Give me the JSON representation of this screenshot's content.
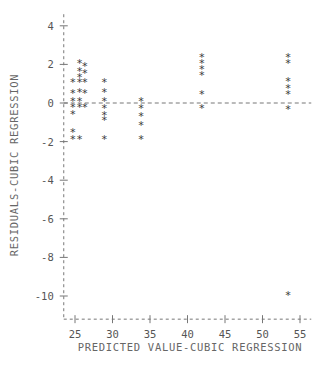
{
  "chart_data": {
    "type": "scatter",
    "title": "",
    "xlabel": "PREDICTED VALUE-CUBIC REGRESSION",
    "ylabel": "RESIDUALS-CUBIC REGRESSION",
    "xlim": [
      23.5,
      56.5
    ],
    "ylim": [
      -11.2,
      4.6
    ],
    "xticks": [
      25,
      30,
      35,
      40,
      45,
      50,
      55
    ],
    "xtick_labels": [
      "25",
      "30",
      "35",
      "40",
      "45",
      "50",
      "55"
    ],
    "yticks": [
      4,
      2,
      0,
      -2,
      -4,
      -6,
      -8,
      -10
    ],
    "ytick_labels": [
      "4",
      "2",
      "0",
      "-2",
      "-4",
      "-6",
      "-8",
      "-10"
    ],
    "grid": false,
    "legend": null,
    "marker_symbol": "*",
    "reference_line_y": 0,
    "points": [
      {
        "x": 24.7,
        "y": 1.05
      },
      {
        "x": 24.7,
        "y": 0.45
      },
      {
        "x": 24.7,
        "y": 0.05
      },
      {
        "x": 24.7,
        "y": -0.25
      },
      {
        "x": 24.7,
        "y": -0.6
      },
      {
        "x": 24.7,
        "y": -1.55
      },
      {
        "x": 24.7,
        "y": -1.9
      },
      {
        "x": 25.6,
        "y": 2.0
      },
      {
        "x": 25.6,
        "y": 1.6
      },
      {
        "x": 25.6,
        "y": 1.3
      },
      {
        "x": 25.6,
        "y": 1.05
      },
      {
        "x": 25.6,
        "y": 0.5
      },
      {
        "x": 25.6,
        "y": 0.05
      },
      {
        "x": 25.6,
        "y": -0.25
      },
      {
        "x": 25.6,
        "y": -1.9
      },
      {
        "x": 26.3,
        "y": 1.85
      },
      {
        "x": 26.3,
        "y": 1.5
      },
      {
        "x": 26.3,
        "y": 1.05
      },
      {
        "x": 26.3,
        "y": 0.45
      },
      {
        "x": 26.3,
        "y": -0.25
      },
      {
        "x": 28.9,
        "y": 1.05
      },
      {
        "x": 28.9,
        "y": 0.5
      },
      {
        "x": 28.9,
        "y": 0.05
      },
      {
        "x": 28.9,
        "y": -0.3
      },
      {
        "x": 28.9,
        "y": -0.65
      },
      {
        "x": 28.9,
        "y": -0.95
      },
      {
        "x": 28.9,
        "y": -1.9
      },
      {
        "x": 33.8,
        "y": 0.05
      },
      {
        "x": 33.8,
        "y": -0.3
      },
      {
        "x": 33.8,
        "y": -0.75
      },
      {
        "x": 33.8,
        "y": -1.2
      },
      {
        "x": 33.8,
        "y": -1.9
      },
      {
        "x": 41.9,
        "y": 2.35
      },
      {
        "x": 41.9,
        "y": 2.0
      },
      {
        "x": 41.9,
        "y": 1.7
      },
      {
        "x": 41.9,
        "y": 1.4
      },
      {
        "x": 41.9,
        "y": 0.4
      },
      {
        "x": 41.9,
        "y": -0.3
      },
      {
        "x": 53.4,
        "y": 2.35
      },
      {
        "x": 53.4,
        "y": 2.0
      },
      {
        "x": 53.4,
        "y": 1.1
      },
      {
        "x": 53.4,
        "y": 0.75
      },
      {
        "x": 53.4,
        "y": 0.4
      },
      {
        "x": 53.4,
        "y": -0.35
      },
      {
        "x": 53.4,
        "y": -10.0
      }
    ]
  },
  "colors": {
    "marker": "#3a3a3a",
    "axis": "#777777",
    "text": "#555555",
    "background": "#ffffff"
  }
}
